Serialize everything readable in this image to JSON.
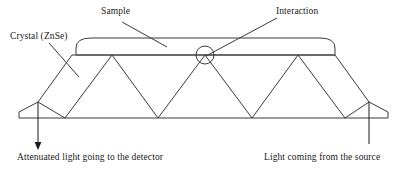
{
  "figure": {
    "background_color": "#ffffff",
    "stroke_color": "#3a3a3a",
    "text_color": "#1a1a1a",
    "width": 407,
    "height": 173
  },
  "labels": {
    "sample": "Sample",
    "interaction": "Interaction",
    "crystal": "Crystal (ZnSe)",
    "attenuated": "Attenuated light going to the detector",
    "source": "Light coming from the source"
  },
  "geometry": {
    "crystal_outline": "72,55 335,55 369,102 388,112 388,118 19,118 19,112 38,102 72,55",
    "crystal_top_edge": "72,55 335,55",
    "crystal_bottom_edge": "19,118 388,118",
    "sample_left": 76,
    "sample_right": 335,
    "sample_top": 38,
    "sample_bottom": 55,
    "sample_corner_radius": 15,
    "beam_path": "38,102 65,118 112,55 158,118 205,55 252,118 298,55 345,118 369,102",
    "interaction_circle": {
      "cx": 205,
      "cy": 55,
      "r": 9
    },
    "detector_arrow": {
      "x": 38,
      "y_start": 102,
      "y_end": 150
    },
    "source_line": {
      "x": 369,
      "y_start": 102,
      "y_end": 143
    },
    "leader_sample": "122,22 167,47",
    "leader_interaction": "277,18 205,55",
    "leader_crystal": "49,43 79,77"
  }
}
